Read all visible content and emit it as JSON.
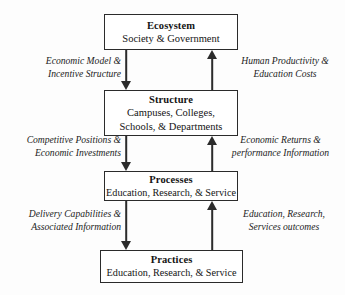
{
  "diagram": {
    "accent_color": "#2b2b2b",
    "background_color": "#fdfdfd",
    "nodes": [
      {
        "id": "ecosystem",
        "title": "Ecosystem",
        "subtitle": "Society & Government"
      },
      {
        "id": "structure",
        "title": "Structure",
        "subtitle_line1": "Campuses, Colleges,",
        "subtitle_line2": "Schools, & Departments"
      },
      {
        "id": "processes",
        "title": "Processes",
        "subtitle": "Education, Research, & Service"
      },
      {
        "id": "practices",
        "title": "Practices",
        "subtitle": "Education, Research, & Service"
      }
    ],
    "edges": [
      {
        "id": "eco-to-str",
        "direction": "down",
        "from": "ecosystem",
        "to": "structure",
        "label_line1": "Economic Model &",
        "label_line2": "Incentive Structure"
      },
      {
        "id": "str-to-eco",
        "direction": "up",
        "from": "structure",
        "to": "ecosystem",
        "label_line1": "Human Productivity &",
        "label_line2": "Education Costs"
      },
      {
        "id": "str-to-pro",
        "direction": "down",
        "from": "structure",
        "to": "processes",
        "label_line1": "Competitive Positions &",
        "label_line2": "Economic Investments"
      },
      {
        "id": "pro-to-str",
        "direction": "up",
        "from": "processes",
        "to": "structure",
        "label_line1": "Economic Returns &",
        "label_line2": "performance Information"
      },
      {
        "id": "pro-to-pra",
        "direction": "down",
        "from": "processes",
        "to": "practices",
        "label_line1": "Delivery Capabilities &",
        "label_line2": "Associated Information"
      },
      {
        "id": "pra-to-pro",
        "direction": "up",
        "from": "practices",
        "to": "processes",
        "label_line1": "Education, Research,",
        "label_line2": "Services outcomes"
      }
    ]
  }
}
